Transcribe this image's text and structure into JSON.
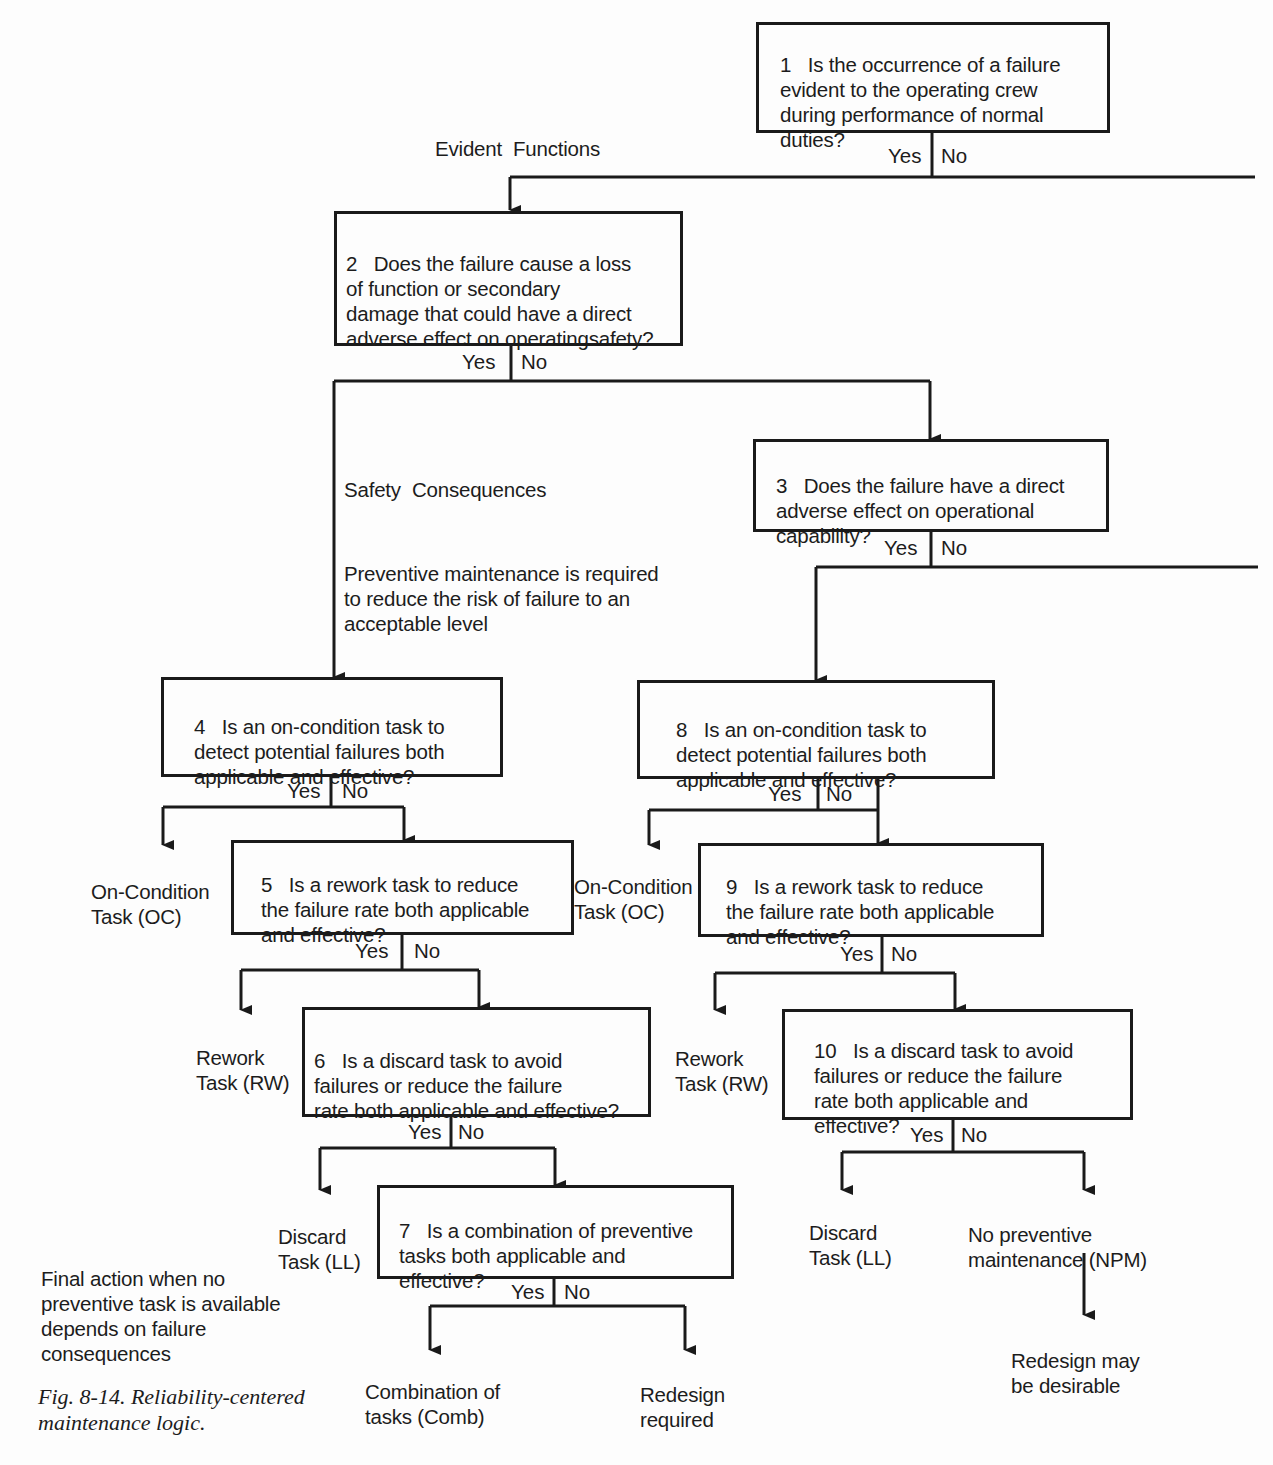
{
  "figure": {
    "caption_line1": "Fig. 8-14. Reliability-centered",
    "caption_line2": "maintenance logic."
  },
  "section_labels": {
    "evident_functions": "Evident  Functions",
    "safety_consequences": "Safety  Consequences",
    "safety_note": [
      "Preventive maintenance is required",
      "to reduce the risk of failure to an",
      "acceptable level"
    ],
    "final_action_note": [
      "Final action when no",
      "preventive task is available",
      "depends on failure",
      "consequences"
    ]
  },
  "questions": [
    {
      "id": 1,
      "lines": [
        "1   Is the occurrence of a failure",
        "evident to the operating crew",
        "during performance of normal",
        "duties?"
      ],
      "yes": "Yes",
      "no": "No"
    },
    {
      "id": 2,
      "lines": [
        "2   Does the failure cause a loss",
        "of function or secondary",
        "damage that could have a direct",
        "adverse effect on operatingsafety?"
      ],
      "yes": "Yes",
      "no": "No"
    },
    {
      "id": 3,
      "lines": [
        "3   Does the failure have a direct",
        "adverse effect on operational",
        "capability?"
      ],
      "yes": "Yes",
      "no": "No"
    },
    {
      "id": 4,
      "lines": [
        "4   Is an on-condition task to",
        "detect potential failures both",
        "applicable and effective?"
      ],
      "yes": "Yes",
      "no": "No"
    },
    {
      "id": 5,
      "lines": [
        "5   Is a rework task to reduce",
        "the failure rate both applicable",
        "and effective?"
      ],
      "yes": "Yes",
      "no": "No"
    },
    {
      "id": 6,
      "lines": [
        "6   Is a discard task to avoid",
        "failures or reduce the failure",
        "rate both applicable and effective?"
      ],
      "yes": "Yes",
      "no": "No"
    },
    {
      "id": 7,
      "lines": [
        "7   Is a combination of preventive",
        "tasks both applicable and",
        "effective?"
      ],
      "yes": "Yes",
      "no": "No"
    },
    {
      "id": 8,
      "lines": [
        "8   Is an on-condition task to",
        "detect potential failures both",
        "applicable and effective?"
      ],
      "yes": "Yes",
      "no": "No"
    },
    {
      "id": 9,
      "lines": [
        "9   Is a rework task to reduce",
        "the failure rate both applicable",
        "and effective?"
      ],
      "yes": "Yes",
      "no": "No"
    },
    {
      "id": 10,
      "lines": [
        "10   Is a discard task to avoid",
        "failures or reduce the failure",
        "rate both applicable and",
        "effective?"
      ],
      "yes": "Yes",
      "no": "No"
    }
  ],
  "outcomes": {
    "oc_left": [
      "On-Condition",
      "Task (OC)"
    ],
    "oc_right": [
      "On-Condition",
      "Task (OC)"
    ],
    "rw_left": [
      "Rework",
      "Task (RW)"
    ],
    "rw_right": [
      "Rework",
      "Task (RW)"
    ],
    "ll_left": [
      "Discard",
      "Task (LL)"
    ],
    "ll_right": [
      "Discard",
      "Task (LL)"
    ],
    "comb": [
      "Combination of",
      "tasks (Comb)"
    ],
    "redesign_required": [
      "Redesign",
      "required"
    ],
    "npm": [
      "No preventive",
      "maintenance (NPM)"
    ],
    "redesign_desirable": [
      "Redesign may",
      "be desirable"
    ]
  }
}
